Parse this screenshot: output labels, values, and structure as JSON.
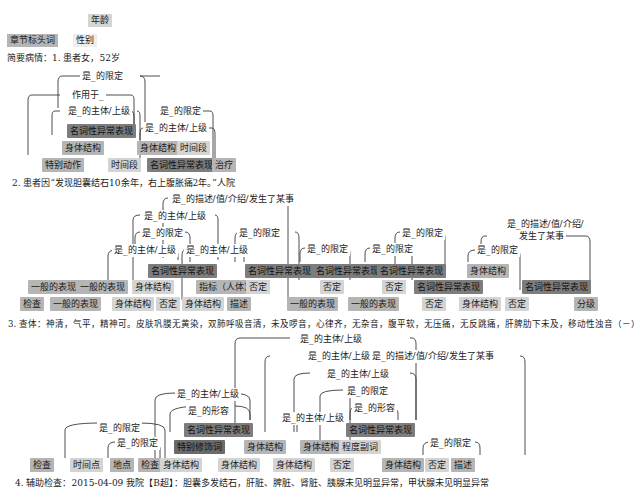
{
  "legend": {
    "age": "年龄",
    "chapter_heading": "章节标头词",
    "gender": "性别"
  },
  "section1": {
    "text": "简要病情：1. 患者女，52岁",
    "relations": [
      "是_的限定",
      "作用于_",
      "是_的主体/上级",
      "是_的限定",
      "是_的主体/上级"
    ],
    "tags": [
      "名词性异常表现",
      "身体结构",
      "身体结构",
      "时间段",
      "特别动作",
      "时间段",
      "名词性异常表现",
      "治疗"
    ]
  },
  "section2": {
    "text": "2. 患者因“发现胆囊结石10余年，右上腹胀痛2年。”人院"
  },
  "section3": {
    "text": "3. 查体：神清，气平，精神可。皮肤巩膜无黄染，双肺呼吸音清，未及啰音，心律齐，无杂音，腹平软，无压痛，无反跳痛，肝脾肋下未及，移动性浊音（－）",
    "relations": [
      "是_的描述/值/介绍/发生了某事",
      "是_的主体/上级",
      "是_的限定",
      "是_的主体/上级",
      "是_的主体/上级",
      "是_的限定",
      "是_的限定",
      "是_的限定",
      "是_的限定",
      "是_的描述/值/介绍/",
      "发生了某事",
      "是_的限定"
    ],
    "tags": [
      "名词性异常表现",
      "名词性异常表现",
      "名词性异常表现",
      "名词性异常表现",
      "名词性异常表现",
      "身体结构",
      "名词性异常表现",
      "一般的表现",
      "一般的表现",
      "身体结构",
      "指标（人体）",
      "否定",
      "否定",
      "否定",
      "检查",
      "一般的表现",
      "身体结构",
      "否定",
      "身体结构",
      "描述",
      "一般的表现",
      "一般的表现",
      "否定",
      "身体结构",
      "否定",
      "分级"
    ]
  },
  "section4": {
    "text": "4. 辅助检查：2015-04-09 我院【B超】：胆囊多发结石，肝脏、脾脏、肾脏、胰腺未见明显异常，甲状腺未见明显异常",
    "relations": [
      "是_的主体/上级",
      "是_的主体/上级",
      "是_的描述/值/介绍/发生了某事",
      "是_的主体/上级",
      "是_的限定",
      "是_的形容",
      "是_的主体/上级",
      "是_的主体/上级",
      "是_的形容",
      "是_的限定",
      "是_的限定",
      "是_的限定"
    ],
    "tags": [
      "名词性异常表现",
      "名词性异常表现",
      "特别修饰词",
      "身体结构",
      "身体结构",
      "程度副词",
      "检查",
      "时间点",
      "地点",
      "检查",
      "身体结构",
      "身体结构",
      "身体结构",
      "否定",
      "身体结构",
      "否定",
      "描述"
    ]
  }
}
